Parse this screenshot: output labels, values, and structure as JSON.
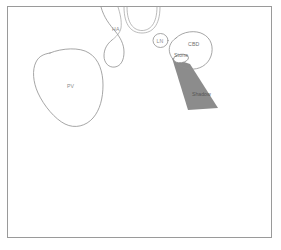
{
  "figure": {
    "type": "line-drawing-schematic",
    "caption_present": false,
    "background_color": "#ffffff",
    "frame_color": "#9a9a9a",
    "outline_color": "#8f8f8f",
    "label_color": "#8d8d8d",
    "shadow_fill_color": "#8c8c8c",
    "shadow_label_color": "#565656"
  },
  "labels": {
    "pv": "PV",
    "ha": "HA",
    "ln": "LN",
    "cbd": "CBD",
    "stone": "Stone",
    "shadow": "Shadow"
  },
  "structures": [
    {
      "id": "portal-vein",
      "label": "PV",
      "shape": "large-rounded-blob",
      "position": "left-center",
      "filled": false
    },
    {
      "id": "arch-structure",
      "label": "",
      "shape": "double-line-arch",
      "position": "top-center",
      "filled": false
    },
    {
      "id": "hepatic-artery",
      "label": "HA",
      "shape": "hooked-tube",
      "position": "upper-center-left",
      "filled": false
    },
    {
      "id": "lymph-node",
      "label": "LN",
      "shape": "small-circle",
      "position": "upper-center-right",
      "filled": false
    },
    {
      "id": "common-bile-duct",
      "label": "CBD",
      "shape": "oval-blob",
      "position": "upper-right",
      "filled": false
    },
    {
      "id": "stone",
      "label": "Stone",
      "shape": "small-oval",
      "position": "inside-cbd-lower-left",
      "filled": false
    },
    {
      "id": "acoustic-shadow",
      "label": "Shadow",
      "shape": "widening-wedge",
      "position": "below-stone",
      "filled": true
    }
  ]
}
